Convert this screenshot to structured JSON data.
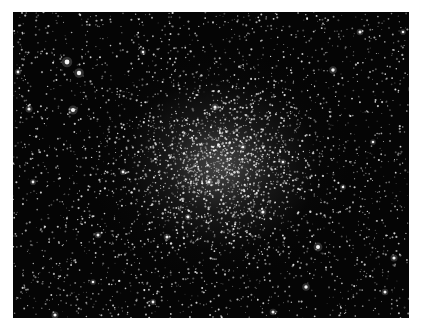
{
  "image": {
    "subject": "globular star cluster",
    "background_color": "#050505",
    "border_color": "#ffffff",
    "cluster_center": [
      207,
      153
    ],
    "star_count": 2600,
    "core_star_count": 1400,
    "bright_stars": [
      [
        54,
        50,
        2.4
      ],
      [
        66,
        61,
        2.2
      ],
      [
        60,
        98,
        2.1
      ],
      [
        202,
        95,
        1.6
      ],
      [
        320,
        58,
        1.7
      ],
      [
        347,
        20,
        1.5
      ],
      [
        130,
        40,
        1.3
      ],
      [
        16,
        97,
        1.6
      ],
      [
        398,
        77,
        1.4
      ],
      [
        305,
        235,
        2.0
      ],
      [
        293,
        275,
        1.7
      ],
      [
        372,
        280,
        1.5
      ],
      [
        381,
        246,
        1.6
      ],
      [
        85,
        223,
        1.5
      ],
      [
        42,
        303,
        1.6
      ],
      [
        154,
        225,
        1.5
      ],
      [
        175,
        205,
        1.4
      ],
      [
        250,
        200,
        1.5
      ],
      [
        270,
        150,
        1.3
      ],
      [
        110,
        160,
        1.4
      ],
      [
        230,
        135,
        1.3
      ],
      [
        196,
        170,
        1.4
      ],
      [
        330,
        175,
        1.3
      ],
      [
        360,
        130,
        1.3
      ],
      [
        20,
        170,
        1.4
      ],
      [
        260,
        300,
        1.5
      ],
      [
        140,
        290,
        1.4
      ],
      [
        80,
        270,
        1.3
      ],
      [
        390,
        20,
        1.3
      ],
      [
        5,
        60,
        1.4
      ]
    ]
  }
}
